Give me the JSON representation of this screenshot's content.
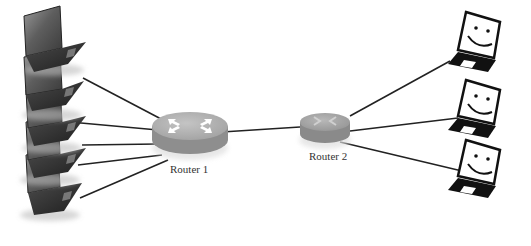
{
  "diagram": {
    "type": "network-topology",
    "routers": [
      {
        "id": "router1",
        "label": "Router 1",
        "color": "#a8a8a8"
      },
      {
        "id": "router2",
        "label": "Router 2",
        "color": "#a0a0a0"
      }
    ],
    "left_hosts": {
      "count": 5,
      "style": "photographic-laptop",
      "connects_to": "router1"
    },
    "right_hosts": {
      "count": 3,
      "style": "smiley-laptop-icon",
      "connects_to": "router2"
    },
    "links": [
      {
        "from": "left_host_1",
        "to": "router1"
      },
      {
        "from": "left_host_2",
        "to": "router1"
      },
      {
        "from": "left_host_3",
        "to": "router1"
      },
      {
        "from": "left_host_4",
        "to": "router1"
      },
      {
        "from": "left_host_5",
        "to": "router1"
      },
      {
        "from": "router1",
        "to": "router2"
      },
      {
        "from": "router2",
        "to": "right_host_1"
      },
      {
        "from": "router2",
        "to": "right_host_2"
      },
      {
        "from": "router2",
        "to": "right_host_3"
      }
    ]
  }
}
